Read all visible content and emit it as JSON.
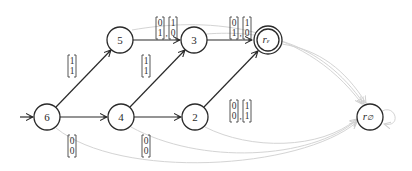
{
  "diagram": {
    "type": "finite automaton",
    "start_state": "6",
    "states": [
      {
        "id": "6",
        "label": "6",
        "accepting": false
      },
      {
        "id": "5",
        "label": "5",
        "accepting": false
      },
      {
        "id": "4",
        "label": "4",
        "accepting": false
      },
      {
        "id": "3",
        "label": "3",
        "accepting": false
      },
      {
        "id": "2",
        "label": "2",
        "accepting": false
      },
      {
        "id": "r_eps",
        "label": "r",
        "subscript": "ε",
        "accepting": true
      },
      {
        "id": "r_empty",
        "label": "r",
        "subscript": "∅",
        "accepting": false
      }
    ],
    "transitions": [
      {
        "from": "6",
        "to": "5",
        "labels": [
          [
            "1",
            "1"
          ]
        ]
      },
      {
        "from": "6",
        "to": "4",
        "labels": [
          [
            "0",
            "0"
          ]
        ]
      },
      {
        "from": "5",
        "to": "3",
        "labels": [
          [
            "0",
            "1"
          ],
          [
            "1",
            "0"
          ]
        ]
      },
      {
        "from": "4",
        "to": "3",
        "labels": [
          [
            "1",
            "1"
          ]
        ]
      },
      {
        "from": "4",
        "to": "2",
        "labels": [
          [
            "0",
            "0"
          ]
        ]
      },
      {
        "from": "3",
        "to": "r_eps",
        "labels": [
          [
            "0",
            "1"
          ],
          [
            "1",
            "0"
          ]
        ]
      },
      {
        "from": "2",
        "to": "r_eps",
        "labels": [
          [
            "0",
            "0"
          ],
          [
            "1",
            "1"
          ]
        ]
      }
    ],
    "faded_transitions_to_sink": [
      "6",
      "5",
      "4",
      "3",
      "2",
      "r_eps",
      "r_empty"
    ],
    "colors": {
      "stroke": "#2a2a2a",
      "faded": "#d4d4d4",
      "background": "#ffffff"
    }
  }
}
